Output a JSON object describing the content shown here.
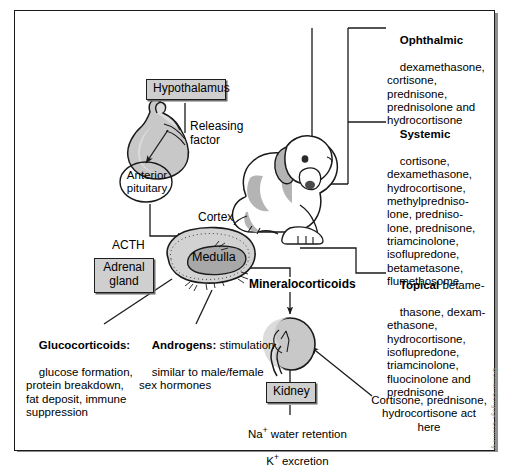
{
  "figure": {
    "credit": "Delmar/Cengage Learning"
  },
  "colors": {
    "ink": "#1a1a1a",
    "box_fill": "#cfcfcf",
    "organ_fill": "#c8c8c8",
    "organ_fill_light": "#dcdcdc",
    "medulla_fill": "#a8a8a8",
    "dog_patch": "#b4b4b4",
    "shadow": "#8d8d8d",
    "page": "#ffffff"
  },
  "boxes": {
    "hypothalamus": "Hypothalamus",
    "adrenal_gland": "Adrenal\ngland",
    "kidney": "Kidney"
  },
  "labels": {
    "releasing_factor": "Releasing\nfactor",
    "anterior_pituitary": "Anterior\npituitary",
    "acth": "ACTH",
    "cortex": "Cortex",
    "medulla": "Medulla",
    "mineralocorticoids": "Mineralocorticoids",
    "kidney_function_line1": "Na",
    "kidney_function_sup1": "+",
    "kidney_function_line1b": " water retention",
    "kidney_function_line2": "K",
    "kidney_function_sup2": "+",
    "kidney_function_line2b": " excretion"
  },
  "callouts": {
    "glucocorticoids": {
      "heading": "Glucocorticoids:",
      "body": "glucose formation,\nprotein breakdown,\nfat deposit, immune\nsuppression"
    },
    "androgens": {
      "heading": "Androgens:",
      "body_inline": " stimulation",
      "body": "similar to male/female\nsex hormones"
    },
    "kidney_action": {
      "body": "Cortisone, prednisone,\nhydrocortisone act\nhere"
    }
  },
  "drug_lists": [
    {
      "heading": "Ophthalmic",
      "inline": "",
      "body": "dexamethasone,\ncortisone,\nprednisone,\nprednisolone and\nhydrocortisone"
    },
    {
      "heading": "Systemic",
      "inline": "",
      "body": "cortisone,\ndexamethasone,\nhydrocortisone,\nmethylpredniso-\nlone, predniso-\nlone, prednisone,\ntriamcinolone,\nisoflupredone,\nbetametasone,\nflumethosome"
    },
    {
      "heading": "Topical",
      "inline": " betame-",
      "body": "thasone, dexam-\nethasone,\nhydrocortisone,\nisoflupredone,\ntriamcinolone,\nfluocinolone and\nprednisone"
    }
  ],
  "organs": {
    "pituitary": "pituitary-gland-illustration",
    "adrenal": "adrenal-gland-cross-section",
    "kidney": "kidney-illustration",
    "dog": "dog-illustration"
  }
}
